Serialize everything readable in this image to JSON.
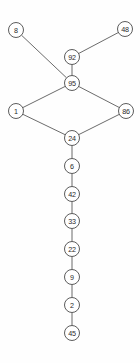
{
  "diagram": {
    "type": "node-link-tree",
    "background_color": "#fefefe",
    "node_fill_color": "#ffffff",
    "node_stroke_color": "#4a4a4a",
    "edge_color": "#5a5a5a",
    "label_color": "#2a2a2a",
    "node_radius": 7.5,
    "nodes": [
      {
        "id": "n8",
        "label": "8",
        "x": 16,
        "y": 30
      },
      {
        "id": "n48",
        "label": "48",
        "x": 125,
        "y": 29
      },
      {
        "id": "n92",
        "label": "92",
        "x": 72,
        "y": 57
      },
      {
        "id": "n95",
        "label": "95",
        "x": 72,
        "y": 83
      },
      {
        "id": "n1",
        "label": "1",
        "x": 16,
        "y": 111
      },
      {
        "id": "n86",
        "label": "86",
        "x": 126,
        "y": 111
      },
      {
        "id": "n24",
        "label": "24",
        "x": 72,
        "y": 138
      },
      {
        "id": "n6",
        "label": "6",
        "x": 72,
        "y": 166
      },
      {
        "id": "n42",
        "label": "42",
        "x": 72,
        "y": 194
      },
      {
        "id": "n33",
        "label": "33",
        "x": 72,
        "y": 221
      },
      {
        "id": "n22",
        "label": "22",
        "x": 72,
        "y": 249
      },
      {
        "id": "n9",
        "label": "9",
        "x": 72,
        "y": 277
      },
      {
        "id": "n2",
        "label": "2",
        "x": 72,
        "y": 305
      },
      {
        "id": "n45",
        "label": "45",
        "x": 72,
        "y": 333
      }
    ],
    "edges": [
      {
        "id": "e1",
        "source": "n8",
        "target": "n95"
      },
      {
        "id": "e2",
        "source": "n48",
        "target": "n92"
      },
      {
        "id": "e3",
        "source": "n92",
        "target": "n95"
      },
      {
        "id": "e4",
        "source": "n95",
        "target": "n1"
      },
      {
        "id": "e5",
        "source": "n95",
        "target": "n86"
      },
      {
        "id": "e6",
        "source": "n1",
        "target": "n24"
      },
      {
        "id": "e7",
        "source": "n86",
        "target": "n24"
      },
      {
        "id": "e8",
        "source": "n24",
        "target": "n6"
      },
      {
        "id": "e9",
        "source": "n6",
        "target": "n42"
      },
      {
        "id": "e10",
        "source": "n42",
        "target": "n33"
      },
      {
        "id": "e11",
        "source": "n33",
        "target": "n22"
      },
      {
        "id": "e12",
        "source": "n22",
        "target": "n9"
      },
      {
        "id": "e13",
        "source": "n9",
        "target": "n2"
      },
      {
        "id": "e14",
        "source": "n2",
        "target": "n45"
      }
    ]
  }
}
